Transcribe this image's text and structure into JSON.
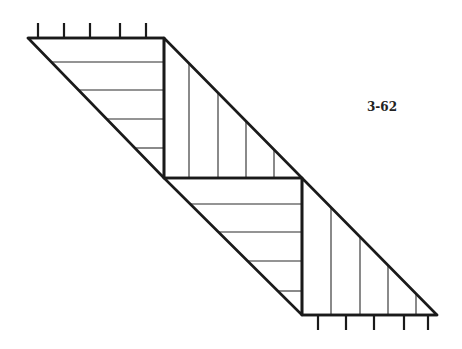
{
  "figure": {
    "label": "3-62",
    "colors": {
      "line": "#1a1a1a",
      "background": "#ffffff"
    },
    "top_support": {
      "edge": {
        "x1": 28,
        "y1": 38,
        "x2": 164,
        "y2": 38
      },
      "ticks_x": [
        38,
        64,
        90,
        120,
        146
      ],
      "tick_top_y": 23
    },
    "bottom_support": {
      "edge": {
        "x1": 302,
        "y1": 315,
        "x2": 437,
        "y2": 315
      },
      "ticks_x": [
        318,
        346,
        374,
        404,
        428
      ],
      "tick_bottom_y": 330
    },
    "triangles": [
      {
        "name": "upper-left-triangle",
        "points": "28,38 164,38 164,178",
        "hatch": "horizontal",
        "hatch_positions": [
          62,
          90,
          119,
          148
        ]
      },
      {
        "name": "upper-right-triangle",
        "points": "164,38 302,178 164,178",
        "hatch": "vertical",
        "hatch_positions": [
          189,
          218,
          246,
          274
        ]
      },
      {
        "name": "lower-left-triangle",
        "points": "164,178 302,178 302,315",
        "hatch": "horizontal",
        "hatch_positions": [
          204,
          232,
          261,
          291
        ]
      },
      {
        "name": "lower-right-triangle",
        "points": "302,178 437,315 302,315",
        "hatch": "vertical",
        "hatch_positions": [
          331,
          360,
          388,
          416
        ]
      }
    ]
  }
}
